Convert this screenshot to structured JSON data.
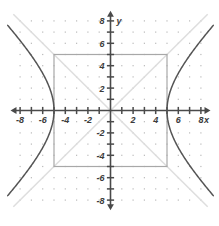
{
  "chart_data": {
    "type": "line",
    "title": "",
    "subtitle": "",
    "xlabel": "x",
    "ylabel": "y",
    "xlim": [
      -8.8,
      8.8
    ],
    "ylim": [
      -8.8,
      8.8
    ],
    "grid": "dot-lattice at integer points",
    "legend": "none",
    "x_ticks": [
      -8,
      -6,
      -4,
      -2,
      2,
      4,
      6,
      8
    ],
    "y_ticks": [
      8,
      6,
      4,
      2,
      -2,
      -4,
      -6,
      -8
    ],
    "x_tick_labels": [
      "-8",
      "-6",
      "-4",
      "-2",
      "2",
      "4",
      "6",
      "8"
    ],
    "y_tick_labels": [
      "8",
      "6",
      "4",
      "2",
      "-2",
      "-4",
      "-6",
      "-8"
    ],
    "tick_step": 1,
    "labeled_tick_step": 2,
    "series": [
      {
        "name": "hyperbola-right-branch",
        "equation": "x^2/25 - y^2/25 = 1, x >= 5",
        "color": "#555555",
        "vertex": [
          5,
          0
        ],
        "points": [
          [
            5,
            0
          ],
          [
            5.05,
            0.707
          ],
          [
            5.099,
            1
          ],
          [
            5.385,
            2
          ],
          [
            5.831,
            3
          ],
          [
            6.403,
            4
          ],
          [
            7.071,
            5
          ],
          [
            7.81,
            6
          ],
          [
            8.602,
            7
          ]
        ]
      },
      {
        "name": "hyperbola-left-branch",
        "equation": "x^2/25 - y^2/25 = 1, x <= -5",
        "color": "#555555",
        "vertex": [
          -5,
          0
        ],
        "points": [
          [
            -5,
            0
          ],
          [
            -5.05,
            0.707
          ],
          [
            -5.099,
            1
          ],
          [
            -5.385,
            2
          ],
          [
            -5.831,
            3
          ],
          [
            -6.403,
            4
          ],
          [
            -7.071,
            5
          ],
          [
            -7.81,
            6
          ],
          [
            -8.602,
            7
          ]
        ]
      },
      {
        "name": "asymptote-positive-slope",
        "equation": "y = x",
        "color": "#dedede",
        "points": [
          [
            -8.6,
            -8.6
          ],
          [
            8.6,
            8.6
          ]
        ]
      },
      {
        "name": "asymptote-negative-slope",
        "equation": "y = -x",
        "color": "#dedede",
        "points": [
          [
            -8.6,
            8.6
          ],
          [
            8.6,
            -8.6
          ]
        ]
      }
    ],
    "shapes": [
      {
        "name": "central-rectangle",
        "type": "rect",
        "x_range": [
          -5,
          5
        ],
        "y_range": [
          -5,
          5
        ],
        "color": "#a8a8a8",
        "fill": "none"
      }
    ],
    "colors": {
      "axis": "#4a4a4a",
      "curve": "#555555",
      "asymptote": "#dedede",
      "rectangle": "#a8a8a8",
      "grid_dot": "#b9b9b9",
      "background": "#ffffff",
      "label": "#3c3c3c"
    }
  },
  "axis_labels": {
    "x": "x",
    "y": "y"
  }
}
